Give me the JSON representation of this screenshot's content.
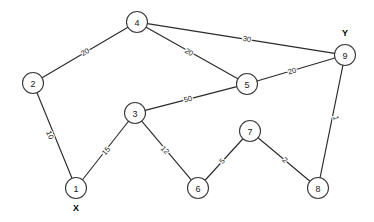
{
  "diagram": {
    "type": "node-link-graph",
    "width": 374,
    "height": 222,
    "background_color": "#ffffff",
    "stroke_color": "#2b2b2b",
    "node_fill": "#ffffff",
    "node_radius": 10.5
  },
  "nodes": [
    {
      "id": "1",
      "label": "1",
      "x": 76,
      "y": 188
    },
    {
      "id": "2",
      "label": "2",
      "x": 33,
      "y": 83
    },
    {
      "id": "3",
      "label": "3",
      "x": 135,
      "y": 113
    },
    {
      "id": "4",
      "label": "4",
      "x": 137,
      "y": 22
    },
    {
      "id": "5",
      "label": "5",
      "x": 247,
      "y": 84
    },
    {
      "id": "6",
      "label": "6",
      "x": 198,
      "y": 188
    },
    {
      "id": "7",
      "label": "7",
      "x": 250,
      "y": 131
    },
    {
      "id": "8",
      "label": "8",
      "x": 318,
      "y": 188
    },
    {
      "id": "9",
      "label": "9",
      "x": 345,
      "y": 55
    }
  ],
  "edges": [
    {
      "source": "2",
      "target": "4",
      "weight": "20",
      "lx": 85,
      "ly": 52,
      "rot": -30
    },
    {
      "source": "4",
      "target": "5",
      "weight": "20",
      "lx": 189,
      "ly": 52,
      "rot": 29
    },
    {
      "source": "4",
      "target": "9",
      "weight": "30",
      "lx": 247,
      "ly": 39,
      "rot": 9
    },
    {
      "source": "5",
      "target": "9",
      "weight": "20",
      "lx": 292,
      "ly": 71,
      "rot": -17
    },
    {
      "source": "3",
      "target": "5",
      "weight": "50",
      "lx": 188,
      "ly": 99,
      "rot": -14
    },
    {
      "source": "2",
      "target": "1",
      "weight": "10",
      "lx": 50,
      "ly": 135,
      "rot": 68
    },
    {
      "source": "1",
      "target": "3",
      "weight": "15",
      "lx": 106,
      "ly": 151,
      "rot": -51
    },
    {
      "source": "3",
      "target": "6",
      "weight": "12",
      "lx": 165,
      "ly": 150,
      "rot": 47
    },
    {
      "source": "6",
      "target": "7",
      "weight": "5",
      "lx": 222,
      "ly": 161,
      "rot": -47
    },
    {
      "source": "7",
      "target": "8",
      "weight": "2",
      "lx": 285,
      "ly": 160,
      "rot": 40
    },
    {
      "source": "9",
      "target": "8",
      "weight": "1",
      "lx": 336,
      "ly": 118,
      "rot": 78
    }
  ],
  "terminals": [
    {
      "name": "source-terminal",
      "label": "X",
      "x": 76,
      "y": 208
    },
    {
      "name": "sink-terminal",
      "label": "Y",
      "x": 345,
      "y": 33
    }
  ]
}
